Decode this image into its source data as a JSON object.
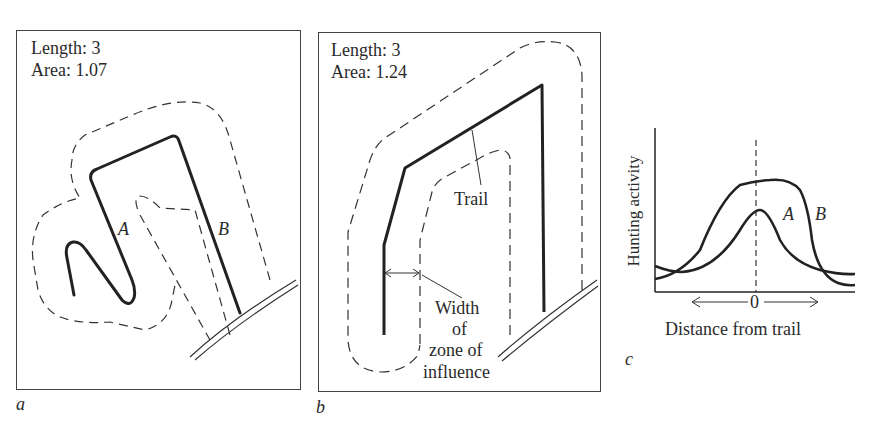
{
  "panel_a": {
    "length_label": "Length: 3",
    "area_label": "Area: 1.07",
    "trail_label_a": "A",
    "trail_label_b": "B",
    "caption": "a"
  },
  "panel_b": {
    "length_label": "Length: 3",
    "area_label": "Area: 1.24",
    "trail_label": "Trail",
    "width_label_lines": [
      "Width",
      "of",
      "zone of",
      "influence"
    ],
    "caption": "b"
  },
  "panel_c": {
    "ylabel": "Hunting activity",
    "xlabel": "Distance from trail",
    "zero_tick": "0",
    "series_a_label": "A",
    "series_b_label": "B",
    "caption": "c"
  },
  "colors": {
    "ink": "#2a2a2a",
    "background": "#ffffff"
  }
}
